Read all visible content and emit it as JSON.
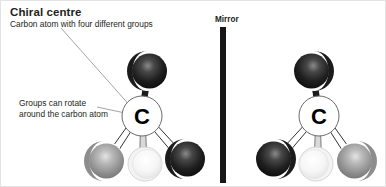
{
  "figure": {
    "kind": "chemistry-diagram",
    "background_color": "#ffffff"
  },
  "annotations": {
    "title": "Chiral centre",
    "subtitle": "Carbon atom with four different groups",
    "note": "Groups can rotate around the carbon atom",
    "mirror_label": "Mirror"
  },
  "center_atom": {
    "label": "C",
    "outline_color": "#6b6b6b",
    "text_color": "#000000"
  },
  "palette": {
    "black_group": "#1a1a1a",
    "gray_group": "#8d8d8d",
    "white_group": "#f2f2f2",
    "bond_color": "#111111",
    "leader_line_color": "#9a9a9a",
    "mirror_bar_color": "#17171a",
    "text_color": "#231f20"
  },
  "molecules": [
    {
      "name": "left-molecule",
      "side": "left",
      "center": {
        "x": 141,
        "y": 115
      },
      "atoms": [
        {
          "id": "top",
          "group": "black",
          "x": 146,
          "y": 70,
          "r": 20
        },
        {
          "id": "lower-left",
          "group": "gray",
          "x": 103,
          "y": 160,
          "r": 20
        },
        {
          "id": "lower-mid",
          "group": "white",
          "x": 144,
          "y": 163,
          "r": 17
        },
        {
          "id": "lower-right",
          "group": "black",
          "x": 184,
          "y": 158,
          "r": 20
        }
      ]
    },
    {
      "name": "right-molecule",
      "side": "right",
      "center": {
        "x": 318,
        "y": 115
      },
      "atoms": [
        {
          "id": "top",
          "group": "black",
          "x": 313,
          "y": 70,
          "r": 20
        },
        {
          "id": "lower-left",
          "group": "black",
          "x": 275,
          "y": 158,
          "r": 20
        },
        {
          "id": "lower-mid",
          "group": "white",
          "x": 315,
          "y": 163,
          "r": 17
        },
        {
          "id": "lower-right",
          "group": "gray",
          "x": 356,
          "y": 160,
          "r": 20
        }
      ]
    }
  ]
}
